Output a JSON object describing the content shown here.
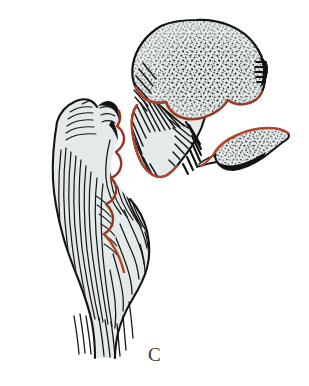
{
  "figure": {
    "label": "C",
    "caption_letter": "C",
    "background_color": "#ffffff",
    "ink_color": "#1a1a1a",
    "bone_fill_color": "#e4eaea",
    "fracture_line_color": "#b0452f",
    "label_color": "#3a3a3a"
  },
  "fragments": [
    {
      "id": "femoral-head-neck",
      "name": "femoral head and neck fragment",
      "fill": "#e4eaea",
      "outline": "#1a1a1a",
      "texture": "stipple",
      "fracture_edge_color": "#b0452f"
    },
    {
      "id": "lesser-trochanter-fragment",
      "name": "lesser trochanter butterfly fragment",
      "fill": "#e4eaea",
      "outline": "#1a1a1a",
      "texture": "stipple",
      "fracture_edge_color": "#b0452f"
    },
    {
      "id": "trochanteric-shaft",
      "name": "greater trochanter and femoral shaft fragment",
      "fill": "#e4eaea",
      "outline": "#1a1a1a",
      "texture": "line-hatching",
      "fracture_edge_color": "#b0452f"
    }
  ]
}
